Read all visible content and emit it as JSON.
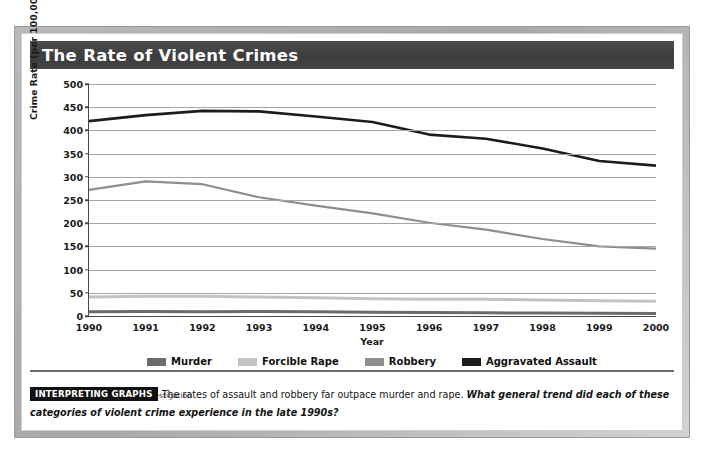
{
  "figure": {
    "title": "The Rate of Violent Crimes",
    "source_note": "Source: Federal Bureau of Investigation"
  },
  "caption": {
    "badge": "INTERPRETING GRAPHS",
    "statement": "The rates of assault and robbery far outpace murder and rape.",
    "question": "What general trend did each of these categories of violent crime experience in the late 1990s?"
  },
  "colors": {
    "title_bar": "#434343",
    "title_text": "#ffffff",
    "gridline": "#a5a5a5",
    "axis": "#4a4a4a",
    "murder": "#6b6b6b",
    "forcible_rape": "#c2c2c2",
    "robbery": "#8e8e8e",
    "aggravated_assault": "#1c1c1c",
    "badge_background": "#111111",
    "frame": "#b0b0b0"
  },
  "chart_data": {
    "type": "line",
    "title": "The Rate of Violent Crimes",
    "xlabel": "Year",
    "ylabel": "Crime Rate (per 100,000 population)",
    "xlim": [
      1990,
      2000
    ],
    "ylim": [
      0,
      500
    ],
    "ytick_step": 50,
    "grid": true,
    "legend_position": "bottom",
    "categories": [
      1990,
      1991,
      1992,
      1993,
      1994,
      1995,
      1996,
      1997,
      1998,
      1999,
      2000
    ],
    "xtick_labels": [
      "1990",
      "1991",
      "1992",
      "1993",
      "1994",
      "1995",
      "1996",
      "1997",
      "1998",
      "1999",
      "2000"
    ],
    "ytick_labels": [
      "0",
      "50",
      "100",
      "150",
      "200",
      "250",
      "300",
      "350",
      "400",
      "450",
      "500"
    ],
    "series": [
      {
        "name": "Murder",
        "color": "#6b6b6b",
        "values": [
          9.4,
          9.8,
          9.3,
          9.5,
          9.0,
          8.2,
          7.4,
          6.8,
          6.3,
          5.7,
          5.5
        ]
      },
      {
        "name": "Forcible Rape",
        "color": "#c2c2c2",
        "values": [
          41.2,
          42.3,
          42.8,
          41.1,
          39.3,
          37.1,
          36.3,
          35.9,
          34.5,
          32.8,
          32.0
        ]
      },
      {
        "name": "Robbery",
        "color": "#8e8e8e",
        "values": [
          272,
          290,
          284,
          256,
          238,
          221,
          201,
          186,
          166,
          150,
          145
        ]
      },
      {
        "name": "Aggravated Assault",
        "color": "#1c1c1c",
        "values": [
          420,
          433,
          442,
          441,
          430,
          418,
          391,
          382,
          361,
          334,
          324
        ]
      }
    ]
  }
}
